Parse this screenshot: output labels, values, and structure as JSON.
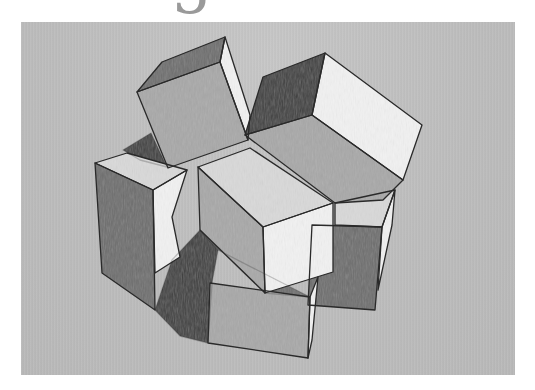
{
  "page": {
    "page_number_glyph": "5"
  },
  "artwork": {
    "title": "Pencil sketch of stacked cubes",
    "medium": "graphite on gray paper",
    "paper_color": "#bdbdbd",
    "shades": {
      "highlight": "#f2f2f2",
      "light": "#d9d9d9",
      "mid": "#a8a8a8",
      "dark": "#6e6e6e",
      "shadow": "#3f3f3f",
      "line": "#2a2a2a"
    },
    "objects": [
      {
        "name": "tilted-top-left-cube",
        "faces": [
          "dark",
          "mid",
          "highlight"
        ]
      },
      {
        "name": "top-right-box",
        "faces": [
          "shadow",
          "highlight",
          "mid"
        ]
      },
      {
        "name": "left-tall-box",
        "faces": [
          "light",
          "dark",
          "highlight"
        ]
      },
      {
        "name": "center-box",
        "faces": [
          "light",
          "mid",
          "highlight"
        ]
      },
      {
        "name": "right-lower-box",
        "faces": [
          "light",
          "dark",
          "highlight"
        ]
      },
      {
        "name": "bottom-box",
        "faces": [
          "mid",
          "highlight"
        ]
      },
      {
        "name": "cast-shadows",
        "faces": [
          "shadow"
        ]
      }
    ]
  }
}
